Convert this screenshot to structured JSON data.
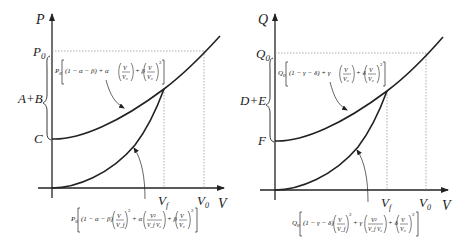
{
  "panels": [
    {
      "id": "left",
      "y_axis_label": "P",
      "x_axis_label": "V",
      "top_level_label": "P",
      "top_level_subscript": "0",
      "brace_label": "A+B",
      "intercept_label": "C",
      "x_ticks": [
        {
          "label": "V",
          "sub": "f"
        },
        {
          "label": "V",
          "sub": "0"
        }
      ],
      "upper_formula": {
        "prefix": "P",
        "prefix_sub": "0",
        "text": "[(1 − α − β) + α(V/V₀) + β(V/V₀)²]",
        "parts": [
          "(1 − α − β) + α",
          "V",
          "V₀",
          "+ β",
          "V",
          "V₀",
          "2"
        ]
      },
      "lower_formula": {
        "prefix": "P",
        "prefix_sub": "0",
        "text": "[(1 − α − β)(V/V_f)² + α(V²/(V_f V₀)) + β(V/V₀)²]",
        "parts": [
          "(1 − α − β)",
          "V",
          "V_f",
          "2",
          "+ α",
          "V²",
          "V_f V₀",
          "+ β",
          "V",
          "V₀",
          "2"
        ]
      }
    },
    {
      "id": "right",
      "y_axis_label": "Q",
      "x_axis_label": "V",
      "top_level_label": "Q",
      "top_level_subscript": "0",
      "brace_label": "D+E",
      "intercept_label": "F",
      "x_ticks": [
        {
          "label": "V",
          "sub": "f"
        },
        {
          "label": "V",
          "sub": "0"
        }
      ],
      "upper_formula": {
        "prefix": "Q",
        "prefix_sub": "0",
        "text": "[(1 − γ − δ) + γ(V/V₀) + δ(V/V₀)²]",
        "parts": [
          "(1 − γ − δ) + γ",
          "V",
          "V₀",
          "+ δ",
          "V",
          "V₀",
          "2"
        ]
      },
      "lower_formula": {
        "prefix": "Q",
        "prefix_sub": "0",
        "text": "[(1 − γ − δ)(V/V_f)² + γ(V²/(V_f V₀)) + δ(V/V₀)²]",
        "parts": [
          "(1 − γ − δ)",
          "V",
          "V_f",
          "2",
          "+ γ",
          "V²",
          "V_f V₀",
          "+ δ",
          "V",
          "V₀",
          "2"
        ]
      }
    }
  ],
  "colors": {
    "curve": "#222222",
    "axis": "#222222",
    "guide": "#999999",
    "background": "#ffffff"
  }
}
